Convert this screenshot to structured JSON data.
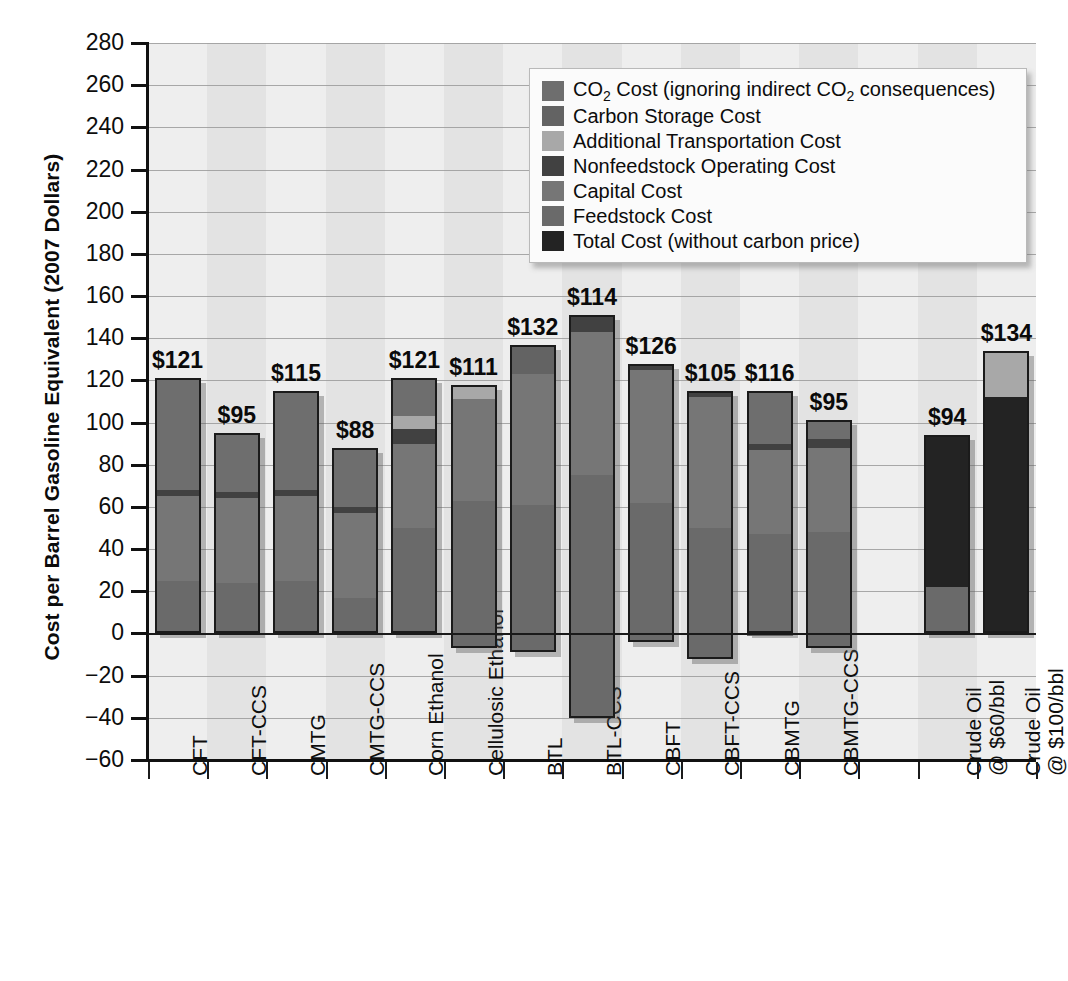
{
  "chart_data": {
    "type": "bar",
    "title": "",
    "subtitle": "",
    "xlabel": "",
    "ylabel": "Cost per Barrel Gasoline Equivalent (2007 Dollars)",
    "ylim": [
      -60,
      280
    ],
    "ytick_step": 20,
    "ytick_labels": [
      "280",
      "260",
      "240",
      "220",
      "200",
      "180",
      "160",
      "140",
      "120",
      "100",
      "80",
      "60",
      "40",
      "20",
      "0",
      "−20",
      "−40",
      "−60"
    ],
    "grid": true,
    "legend_position": "top-right",
    "stacked": true,
    "categories": [
      "CFT",
      "CFT-CCS",
      "CMTG",
      "CMTG-CCS",
      "Corn Ethanol",
      "Cellulosic Ethanol",
      "BTL",
      "BTL-CCS",
      "CBFT",
      "CBFT-CCS",
      "CBMTG",
      "CBMTG-CCS",
      "",
      "Crude Oil @ $60/bbl",
      "Crude Oil @ $100/bbl"
    ],
    "category_lines": [
      [
        "CFT"
      ],
      [
        "CFT-CCS"
      ],
      [
        "CMTG"
      ],
      [
        "CMTG-CCS"
      ],
      [
        "Corn Ethanol"
      ],
      [
        "Cellulosic Ethanol"
      ],
      [
        "BTL"
      ],
      [
        "BTL-CCS"
      ],
      [
        "CBFT"
      ],
      [
        "CBFT-CCS"
      ],
      [
        "CBMTG"
      ],
      [
        "CBMTG-CCS"
      ],
      [
        ""
      ],
      [
        "Crude Oil",
        "@ $60/bbl"
      ],
      [
        "Crude Oil",
        "@ $100/bbl"
      ]
    ],
    "series": [
      {
        "name": "CO₂ Cost (ignoring indirect CO₂ consequences)",
        "color": "#6e6e6e",
        "values": [
          53,
          28,
          47,
          28,
          18,
          0,
          0,
          0,
          0,
          0,
          25,
          9,
          null,
          0,
          0
        ]
      },
      {
        "name": "Carbon Storage Cost",
        "color": "#636363",
        "values": [
          0,
          0,
          0,
          0,
          0,
          0,
          14,
          0,
          0,
          0,
          0,
          0,
          null,
          0,
          0
        ]
      },
      {
        "name": "Additional Transportation Cost",
        "color": "#a8a8a8",
        "values": [
          0,
          0,
          0,
          0,
          6,
          7,
          0,
          0,
          0,
          0,
          0,
          0,
          null,
          0,
          22
        ]
      },
      {
        "name": "Nonfeedstock Operating Cost",
        "color": "#414141",
        "values": [
          3,
          3,
          3,
          3,
          7,
          0,
          0,
          8,
          3,
          3,
          3,
          4,
          null,
          0,
          0
        ]
      },
      {
        "name": "Capital Cost",
        "color": "#767676",
        "values": [
          40,
          40,
          40,
          40,
          40,
          48,
          62,
          68,
          63,
          62,
          40,
          40,
          null,
          0,
          0
        ]
      },
      {
        "name": "Feedstock Cost",
        "color": "#6a6a6a",
        "values": [
          25,
          24,
          25,
          17,
          50,
          56,
          56,
          75,
          60,
          50,
          48,
          42,
          null,
          0,
          0
        ]
      },
      {
        "name": "Total Cost (without carbon price)",
        "color": "#232323",
        "values": [
          0,
          0,
          0,
          0,
          0,
          0,
          0,
          0,
          0,
          0,
          0,
          0,
          null,
          72,
          112
        ]
      }
    ],
    "bar_totals": [
      121,
      95,
      115,
      88,
      121,
      111,
      132,
      114,
      126,
      105,
      116,
      95,
      null,
      94,
      134
    ],
    "bar_total_labels": [
      "$121",
      "$95",
      "$115",
      "$88",
      "$121",
      "$111",
      "$132",
      "$114",
      "$126",
      "$105",
      "$116",
      "$95",
      "",
      "$94",
      "$134"
    ],
    "bar_tops": [
      121,
      95,
      115,
      88,
      121,
      118,
      137,
      151,
      128,
      115,
      115,
      101,
      null,
      94,
      134
    ],
    "bar_bottoms": [
      0,
      0,
      0,
      0,
      0,
      -7,
      -9,
      -40,
      -4,
      -12,
      0,
      -7,
      null,
      0,
      0
    ]
  },
  "legend": {
    "items": [
      {
        "label": "CO",
        "sub": "2",
        "label2": " Cost (ignoring indirect CO",
        "sub2": "2",
        "label3": " consequences)",
        "color": "#6e6e6e",
        "name": "co2-cost"
      },
      {
        "label": "Carbon Storage Cost",
        "color": "#636363",
        "name": "carbon-storage-cost"
      },
      {
        "label": "Additional Transportation Cost",
        "color": "#a8a8a8",
        "name": "additional-transportation-cost"
      },
      {
        "label": "Nonfeedstock Operating Cost",
        "color": "#414141",
        "name": "nonfeedstock-operating-cost"
      },
      {
        "label": "Capital Cost",
        "color": "#767676",
        "name": "capital-cost"
      },
      {
        "label": "Feedstock Cost",
        "color": "#6a6a6a",
        "name": "feedstock-cost"
      },
      {
        "label": "Total Cost (without carbon price)",
        "color": "#232323",
        "name": "total-cost"
      }
    ]
  },
  "colors": {
    "axis": "#111111",
    "grid": "#9a9a9a",
    "plot_background": "#eeeeee",
    "band": "#e3e3e3",
    "bar_outline": "#1b1b1b"
  }
}
